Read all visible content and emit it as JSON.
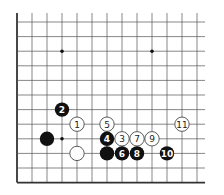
{
  "diagram": {
    "type": "go-board-fragment",
    "grid": {
      "origin_x": 17,
      "origin_y": 22,
      "spacing_x": 15,
      "spacing_y": 14.6,
      "cols": 13,
      "rows": 12,
      "right_extent": 205,
      "line_color": "#555555",
      "edge_color": "#333333",
      "edges": [
        "left",
        "bottom"
      ]
    },
    "star_points": [
      {
        "col": 3,
        "row": 2
      },
      {
        "col": 9,
        "row": 2
      },
      {
        "col": 3,
        "row": 8
      }
    ],
    "stones": [
      {
        "color": "black",
        "col": 3,
        "row": 6,
        "label": "2"
      },
      {
        "color": "white",
        "col": 4,
        "row": 7,
        "label": "1"
      },
      {
        "color": "white",
        "col": 6,
        "row": 7,
        "label": "5"
      },
      {
        "color": "white",
        "col": 11,
        "row": 7,
        "label": "11"
      },
      {
        "color": "black",
        "col": 2,
        "row": 8,
        "label": ""
      },
      {
        "color": "black",
        "col": 6,
        "row": 8,
        "label": "4"
      },
      {
        "color": "white",
        "col": 7,
        "row": 8,
        "label": "3"
      },
      {
        "color": "white",
        "col": 8,
        "row": 8,
        "label": "7"
      },
      {
        "color": "white",
        "col": 9,
        "row": 8,
        "label": "9"
      },
      {
        "color": "white",
        "col": 4,
        "row": 9,
        "label": ""
      },
      {
        "color": "black",
        "col": 6,
        "row": 9,
        "label": ""
      },
      {
        "color": "black",
        "col": 7,
        "row": 9,
        "label": "6"
      },
      {
        "color": "black",
        "col": 8,
        "row": 9,
        "label": "8"
      },
      {
        "color": "black",
        "col": 10,
        "row": 9,
        "label": "10"
      }
    ],
    "colors": {
      "black_stone": "#111111",
      "white_stone": "#ffffff",
      "white_stone_outline": "#333333",
      "label_on_black": "#ffffff",
      "label_on_white": "#222222"
    }
  }
}
